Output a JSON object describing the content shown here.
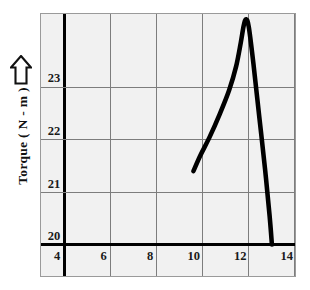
{
  "figure": {
    "background_color": "#ffffff",
    "plot_background_color": "#f1f1f1",
    "plot_border_color": "#9a9a9a",
    "grid_color": "#7d7d7d",
    "axis_color": "#000000",
    "curve_color": "#000000"
  },
  "axes": {
    "y_title": "Torque ( N - m )",
    "y_arrow_icon": "up-arrow-outline-icon",
    "x_title": ""
  },
  "chart_data": {
    "type": "line",
    "title": "",
    "xlabel": "",
    "ylabel": "Torque ( N - m )",
    "xlim": [
      3.0,
      14.0
    ],
    "ylim": [
      19.4,
      24.4
    ],
    "xticks": [
      4,
      6,
      8,
      10,
      12,
      14
    ],
    "xtick_labels": [
      "4",
      "6",
      "8",
      "10",
      "12",
      "14"
    ],
    "yticks": [
      20,
      21,
      22,
      23
    ],
    "ytick_labels": [
      "20",
      "21",
      "22",
      "23"
    ],
    "grid": true,
    "grid_lines_x": [
      4,
      6,
      8,
      10,
      12,
      14
    ],
    "grid_lines_y": [
      20,
      21,
      22,
      23
    ],
    "emphasized_axis_x": 4,
    "emphasized_axis_y": 20,
    "legend": null,
    "annotations": [],
    "series": [
      {
        "name": "Torque",
        "x": [
          9.6,
          9.9,
          10.3,
          10.75,
          11.15,
          11.45,
          11.65,
          11.78,
          11.88,
          12.0,
          12.2,
          12.45,
          12.7,
          12.9,
          13.0
        ],
        "y": [
          21.4,
          21.7,
          22.05,
          22.5,
          22.95,
          23.4,
          23.85,
          24.18,
          24.3,
          24.15,
          23.45,
          22.45,
          21.45,
          20.55,
          20.0
        ]
      }
    ]
  }
}
